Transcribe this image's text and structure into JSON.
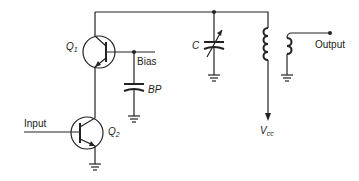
{
  "diagram": {
    "type": "circuit-schematic",
    "labels": {
      "q1": "Q",
      "q1_sub": "1",
      "q2": "Q",
      "q2_sub": "2",
      "bias": "Bias",
      "bp": "BP",
      "c": "C",
      "input": "Input",
      "output": "Output",
      "vcc": "V",
      "vcc_sub": "cc"
    },
    "components": [
      {
        "id": "Q1",
        "kind": "npn-transistor"
      },
      {
        "id": "Q2",
        "kind": "npn-transistor"
      },
      {
        "id": "BP",
        "kind": "capacitor"
      },
      {
        "id": "C",
        "kind": "variable-capacitor"
      },
      {
        "id": "T1",
        "kind": "transformer"
      }
    ],
    "colors": {
      "line": "#222222",
      "background": "#ffffff"
    }
  }
}
